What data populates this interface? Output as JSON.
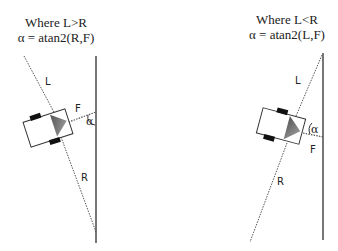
{
  "diagrams": [
    {
      "id": "left",
      "title_line1": "Where L>R",
      "title_line2": "α = atan2(R,F)",
      "labels": {
        "L": "L",
        "F": "F",
        "R": "R",
        "alpha": "α"
      }
    },
    {
      "id": "right",
      "title_line1": "Where L<R",
      "title_line2": "α = atan2(L,F)",
      "labels": {
        "L": "L",
        "F": "F",
        "R": "R",
        "alpha": "α"
      }
    }
  ],
  "colors": {
    "wall": "#777777",
    "dotted_line": "#555555",
    "sensor": "#888888",
    "wheel": "#111111",
    "robot_outline": "#333333"
  }
}
